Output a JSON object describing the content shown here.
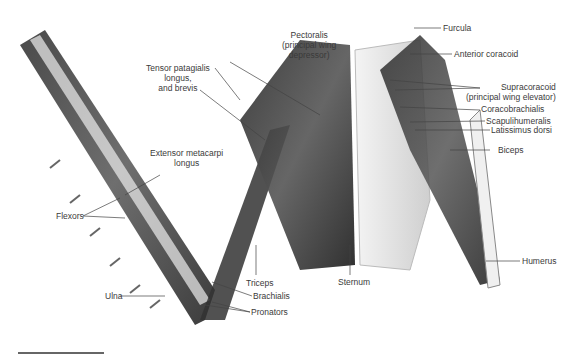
{
  "figure": {
    "labels": {
      "pectoralis": [
        "Pectoralis",
        "(principal wing",
        "depressor)"
      ],
      "tensor": [
        "Tensor patagialis",
        "longus,",
        "and brevis"
      ],
      "extensor": [
        "Extensor metacarpi",
        "longus"
      ],
      "flexors": "Flexors",
      "ulna": "Ulna",
      "triceps": "Triceps",
      "brachialis": "Brachialis",
      "pronators": "Pronators",
      "sternum": "Sternum",
      "furcula": "Furcula",
      "anterior_coracoid": "Anterior coracoid",
      "supracoracoid": [
        "Supracoracoid",
        "(principal wing elevator)"
      ],
      "coracobrachialis": "Coracobrachialis",
      "scapulihumeralis": "Scapulihumeralis",
      "latissimus": "Latissimus dorsi",
      "biceps": "Biceps",
      "humerus": "Humerus"
    },
    "scale_bar": true
  }
}
